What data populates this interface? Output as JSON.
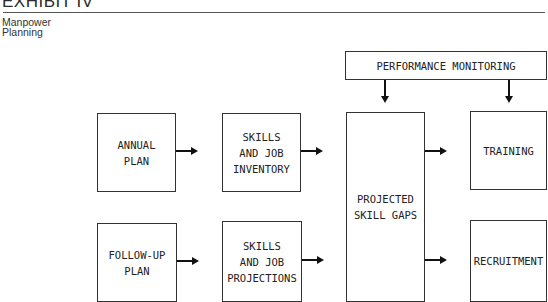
{
  "header": {
    "title": "EXHIBIT IV",
    "subtitle_line1": "Manpower",
    "subtitle_line2": "Planning"
  },
  "diagram": {
    "top_box": "PERFORMANCE MONITORING",
    "inputs": [
      {
        "label": "ANNUAL\nPLAN"
      },
      {
        "label": "FOLLOW-UP\nPLAN"
      }
    ],
    "skills": [
      {
        "label": "SKILLS\nAND JOB\nINVENTORY"
      },
      {
        "label": "SKILLS\nAND JOB\nPROJECTIONS"
      }
    ],
    "center": "PROJECTED\nSKILL GAPS",
    "outputs": [
      {
        "label": "TRAINING"
      },
      {
        "label": "RECRUITMENT"
      }
    ],
    "edges": [
      {
        "from": "ANNUAL PLAN",
        "to": "SKILLS AND JOB INVENTORY"
      },
      {
        "from": "SKILLS AND JOB INVENTORY",
        "to": "PROJECTED SKILL GAPS"
      },
      {
        "from": "FOLLOW-UP PLAN",
        "to": "SKILLS AND JOB PROJECTIONS"
      },
      {
        "from": "SKILLS AND JOB PROJECTIONS",
        "to": "PROJECTED SKILL GAPS"
      },
      {
        "from": "PROJECTED SKILL GAPS",
        "to": "TRAINING"
      },
      {
        "from": "PROJECTED SKILL GAPS",
        "to": "RECRUITMENT"
      },
      {
        "from": "PERFORMANCE MONITORING",
        "to": "PROJECTED SKILL GAPS"
      },
      {
        "from": "PERFORMANCE MONITORING",
        "to": "TRAINING"
      }
    ]
  }
}
